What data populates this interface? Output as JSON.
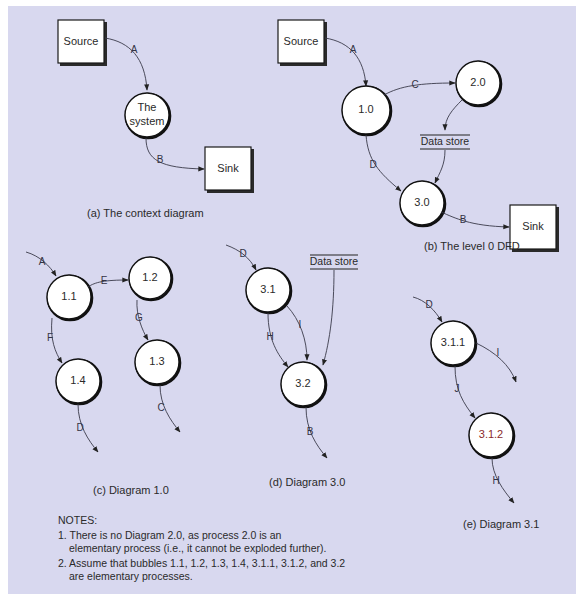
{
  "diagrams": {
    "context": {
      "caption": "(a) The context diagram",
      "source_label": "Source",
      "sink_label": "Sink",
      "system_label_line1": "The",
      "system_label_line2": "system",
      "flows": {
        "in": "A",
        "out": "B"
      }
    },
    "level0": {
      "caption": "(b) The level 0 DFD",
      "source_label": "Source",
      "sink_label": "Sink",
      "processes": [
        "1.0",
        "2.0",
        "3.0"
      ],
      "data_store_label": "Data store",
      "flows": {
        "source_to_1": "A",
        "p1_to_p2": "C",
        "p1_to_p3": "D",
        "p3_to_sink": "B"
      }
    },
    "diagram_1": {
      "caption": "(c) Diagram 1.0",
      "processes": [
        "1.1",
        "1.2",
        "1.3",
        "1.4"
      ],
      "flows": {
        "in_1_1": "A",
        "p11_to_p12": "E",
        "p11_to_p14": "F",
        "p12_to_p13": "G",
        "out_1_3": "C",
        "out_1_4": "D"
      }
    },
    "diagram_3": {
      "caption": "(d) Diagram 3.0",
      "processes": [
        "3.1",
        "3.2"
      ],
      "data_store_label": "Data store",
      "flows": {
        "in_3_1": "D",
        "p31_to_p32_h": "H",
        "p31_to_p32_i": "I",
        "out_3_2": "B"
      }
    },
    "diagram_3_1": {
      "caption": "(e) Diagram 3.1",
      "processes": [
        "3.1.1",
        "3.1.2"
      ],
      "flows": {
        "in_3_1_1": "D",
        "out_3_1_1": "I",
        "p311_to_p312": "J",
        "out_3_1_2": "H"
      }
    }
  },
  "notes": {
    "title": "NOTES:",
    "items": [
      {
        "line1": "1. There is no Diagram 2.0, as process 2.0 is an",
        "line2": "elementary process (i.e., it cannot be exploded further)."
      },
      {
        "line1": "2. Assume that bubbles 1.1, 1.2, 1.3, 1.4, 3.1.1, 3.1.2, and 3.2",
        "line2": "are elementary processes."
      }
    ]
  },
  "colors": {
    "panel_background": "#d8d8ef",
    "bubble_fill": "#ffffff",
    "stroke": "#111111",
    "highlight_label": "#8a2a2a"
  }
}
